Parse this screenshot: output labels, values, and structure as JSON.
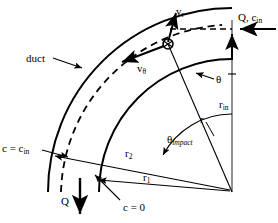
{
  "figure": {
    "type": "technical-diagram",
    "background_color": "#ffffff",
    "line_color": "#000000",
    "width": 278,
    "height": 223
  },
  "labels": {
    "duct": "duct",
    "v_r": "v",
    "v_r_sub": "r",
    "v_theta": "v",
    "v_theta_sub": "θ",
    "inlet": "Q, c",
    "inlet_sub": "in",
    "theta": "θ",
    "r_in": "r",
    "r_in_sub": "in",
    "r": "r",
    "theta_impact": "θ",
    "theta_impact_sub": "impact",
    "c_equals_c_in": "c = c",
    "c_equals_c_in_sub": "in",
    "r_2": "r",
    "r_2_sub": "2",
    "r_1": "r",
    "r_1_sub": "1",
    "Q": "Q",
    "c_equals_zero": "c = 0"
  },
  "geometry": {
    "origin": {
      "x": 232,
      "y": 192
    },
    "arc_outer_radius": 184,
    "arc_inner_radius": 133,
    "arc_trajectory_radius": 172,
    "arc_impact_marker_radius": 78,
    "particle_point": {
      "x": 168,
      "y": 44
    },
    "inlet_arrow_y": 29,
    "vertical_axis_x": 232,
    "vertical_axis_top_y": 20
  },
  "annotations": {
    "dashed_trajectory": "particle streamline",
    "solid_walls": "duct inner and outer walls",
    "velocity_components": [
      "v_r radial",
      "v_theta tangential"
    ]
  }
}
